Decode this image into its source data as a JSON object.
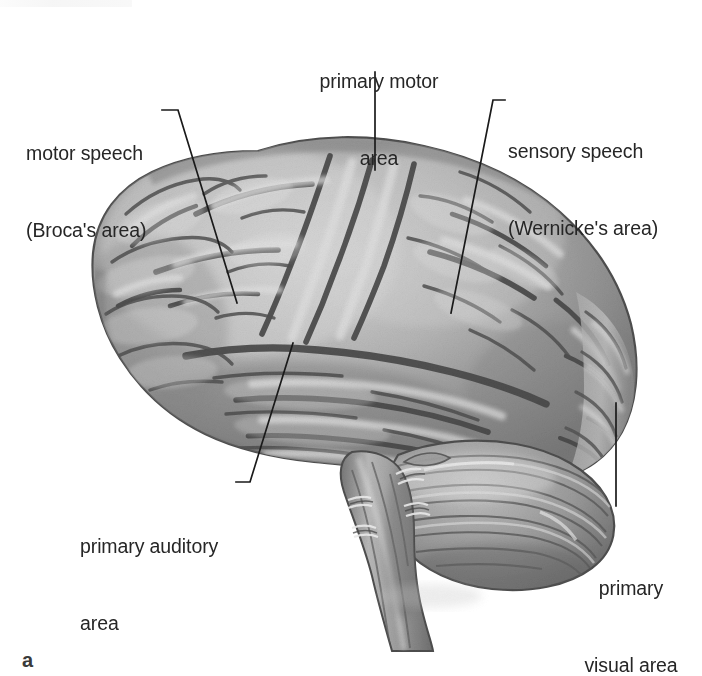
{
  "figure": {
    "part_label": "a",
    "background_color": "#ffffff",
    "ink_color": "#262626",
    "leader_line_color": "#1a1a1a"
  },
  "labels": {
    "motor_speech": {
      "line1": "motor speech",
      "line2": "(Broca's area)"
    },
    "primary_motor": {
      "line1": "primary motor",
      "line2": "area"
    },
    "sensory_speech": {
      "line1": "sensory speech",
      "line2": "(Wernicke's area)"
    },
    "primary_auditory": {
      "line1": "primary auditory",
      "line2": "area"
    },
    "primary_visual": {
      "line1": "primary",
      "line2": "visual area"
    }
  },
  "anatomy": {
    "cerebrum_tone_light": "#c9c9c9",
    "cerebrum_tone_mid": "#9d9d9d",
    "cerebrum_tone_dark": "#5c5c5c",
    "sulcus_color": "#4a4a4a",
    "cerebellum_tone": "#8f8f8f",
    "brainstem_tone": "#9a9a9a"
  }
}
